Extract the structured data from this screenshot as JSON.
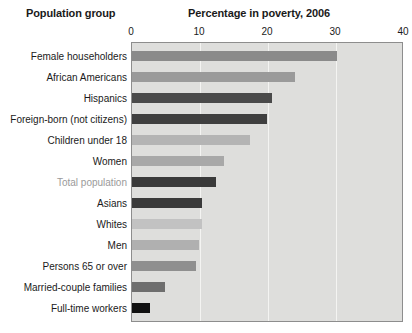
{
  "headers": {
    "group_header": "Population group",
    "chart_title": "Percentage in poverty, 2006"
  },
  "axis": {
    "ticks": [
      "0",
      "10",
      "20",
      "30",
      "40"
    ]
  },
  "chart_data": {
    "type": "bar",
    "orientation": "horizontal",
    "title": "Percentage in poverty, 2006",
    "xlabel": "Percentage in poverty, 2006",
    "ylabel": "Population group",
    "xlim": [
      0,
      40
    ],
    "xticks": [
      0,
      10,
      20,
      30,
      40
    ],
    "grid": true,
    "legend": "none",
    "categories": [
      "Female householders",
      "African Americans",
      "Hispanics",
      "Foreign-born (not citizens)",
      "Children under 18",
      "Women",
      "Total population",
      "Asians",
      "Whites",
      "Men",
      "Persons 65 or over",
      "Married-couple families",
      "Full-time workers"
    ],
    "values": [
      30.1,
      24.0,
      20.6,
      19.8,
      17.4,
      13.6,
      12.3,
      10.3,
      10.3,
      9.9,
      9.4,
      4.9,
      2.7
    ],
    "bar_colors": [
      "#8a8a8a",
      "#9a9a9a",
      "#4a4a4a",
      "#3f3f3f",
      "#b4b4b4",
      "#a8a8a8",
      "#3a3a3a",
      "#3a3a3a",
      "#c2c2c2",
      "#b0b0b0",
      "#8f8f8f",
      "#6e6e6e",
      "#111111"
    ],
    "label_colors": [
      "#1a1a1a",
      "#1a1a1a",
      "#1a1a1a",
      "#1a1a1a",
      "#1a1a1a",
      "#1a1a1a",
      "#9a9a9a",
      "#1a1a1a",
      "#1a1a1a",
      "#1a1a1a",
      "#1a1a1a",
      "#1a1a1a",
      "#1a1a1a"
    ],
    "plot_background": "#dededc",
    "gridline_color": "#f4f4f2",
    "border_color": "#8d8d8d"
  }
}
